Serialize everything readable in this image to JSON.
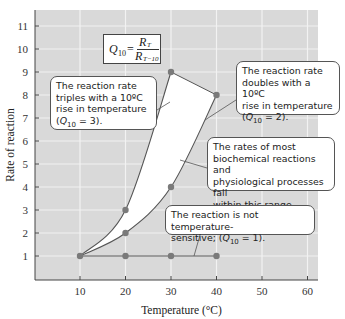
{
  "chart_data": {
    "type": "line",
    "title": "",
    "xlabel": "Temperature (°C)",
    "ylabel": "Rate of reaction",
    "xlim": [
      0,
      62
    ],
    "ylim": [
      0,
      11.5
    ],
    "x_ticks": [
      10,
      20,
      30,
      40,
      50,
      60
    ],
    "y_ticks": [
      1,
      2,
      3,
      4,
      5,
      6,
      7,
      8,
      9,
      10,
      11
    ],
    "grid": true,
    "series": [
      {
        "name": "Q10 = 3",
        "x": [
          10,
          20,
          30
        ],
        "y": [
          1,
          3,
          9
        ]
      },
      {
        "name": "Q10 = 2",
        "x": [
          10,
          20,
          30,
          40
        ],
        "y": [
          1,
          2,
          4,
          8
        ]
      },
      {
        "name": "Q10 = 1",
        "x": [
          10,
          20,
          30,
          40
        ],
        "y": [
          1,
          1,
          1,
          1
        ]
      }
    ],
    "shaded_region": "Between Q10 = 3 and Q10 = 2 curves",
    "annotations": [
      {
        "id": "formula",
        "text": "Q10 = R_T / R_(T-10)"
      },
      {
        "id": "q10_3",
        "text": "The reaction rate triples with a 10ºC rise in temperature (Q10 = 3)."
      },
      {
        "id": "q10_2",
        "text": "The reaction rate doubles with a 10ºC rise in temperature (Q10 = 2)."
      },
      {
        "id": "range",
        "text": "The rates of most biochemical reactions and physiological processes fall within this range."
      },
      {
        "id": "q10_1",
        "text": "The reaction is not temperature-sensitive; (Q10 = 1)."
      }
    ]
  },
  "labels": {
    "xlabel": "Temperature (°C)",
    "ylabel": "Rate of reaction",
    "formula_q": "Q",
    "formula_sub": "10",
    "formula_eq": " =",
    "formula_num": "R",
    "formula_num_sub": "T",
    "formula_den": "R",
    "formula_den_sub": "T−10",
    "q3_l1": "The reaction rate",
    "q3_l2": "triples with a 10ºC",
    "q3_l3": "rise in temperature",
    "q3_l4a": "(",
    "q3_l4q": "Q",
    "q3_l4sub": "10",
    "q3_l4b": " = 3).",
    "q2_l1": "The reaction rate",
    "q2_l2": "doubles with a 10ºC",
    "q2_l3": "rise in temperature",
    "q2_l4a": "(",
    "q2_l4q": "Q",
    "q2_l4sub": "10",
    "q2_l4b": " = 2).",
    "range_l1": "The rates of most",
    "range_l2": "biochemical reactions and",
    "range_l3": "physiological processes fall",
    "range_l4": "within this range.",
    "q1_l1": "The reaction is not temperature-",
    "q1_l2a": "sensitive; (",
    "q1_l2q": "Q",
    "q1_l2sub": "10",
    "q1_l2b": " = 1)."
  },
  "colors": {
    "plot_bg": "#d9d9d9",
    "grid": "#f2f2f2",
    "line": "#555555",
    "point": "#7a7a7a",
    "shade": "#ffffff"
  }
}
